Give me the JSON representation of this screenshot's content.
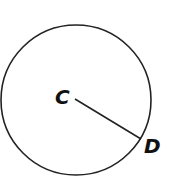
{
  "diagram": {
    "type": "circle-with-radius",
    "circle": {
      "cx": 76,
      "cy": 100,
      "r": 76,
      "stroke": "#222222"
    },
    "radius_segment": {
      "from": "C",
      "to": "D",
      "x1": 75,
      "y1": 99,
      "x2": 141,
      "y2": 139
    },
    "labels": {
      "center": "C",
      "point": "D"
    }
  }
}
